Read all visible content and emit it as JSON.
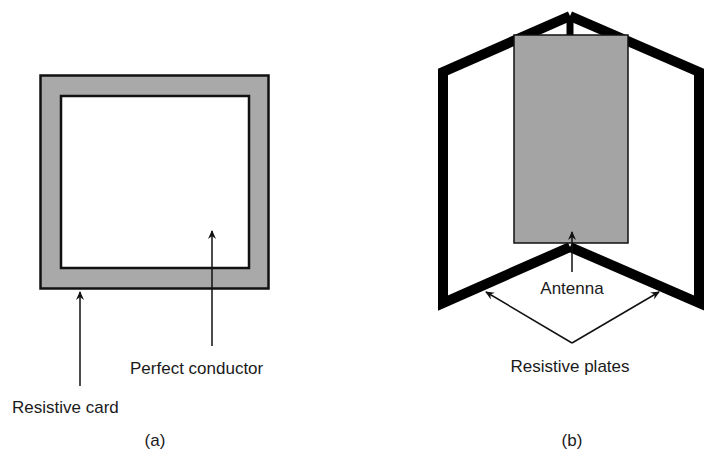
{
  "figure_a": {
    "caption": "(a)",
    "labels": {
      "resistive_card": "Resistive card",
      "perfect_conductor": "Perfect conductor"
    },
    "colors": {
      "card_fill": "#a9a9a9",
      "conductor_fill": "#ffffff",
      "outline": "#111111"
    }
  },
  "figure_b": {
    "caption": "(b)",
    "labels": {
      "antenna": "Antenna",
      "resistive_plates": "Resistive plates"
    },
    "colors": {
      "antenna_fill": "#a4a4a4",
      "plate_stroke": "#000000"
    }
  }
}
